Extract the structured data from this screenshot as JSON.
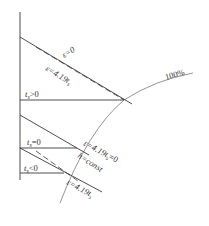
{
  "diagram": {
    "type": "psychrometric-chart-fragment",
    "curve_label": "100%",
    "labels": {
      "eps_zero": "ε=0",
      "eps_419_top": "ε=4.19t",
      "eps_419_top_sub": "s",
      "ts_pos": "t",
      "ts_pos_sub": "s",
      "ts_pos_rel": ">0",
      "ts_zero": "t",
      "ts_zero_sub": "s",
      "ts_zero_rel": "=0",
      "eps_mid": "ε=4.19t",
      "eps_mid_sub": "s",
      "eps_mid_rel": "=0",
      "h_const": "h=const",
      "ts_neg": "t",
      "ts_neg_sub": "s",
      "ts_neg_rel": "<0",
      "eps_419_bottom": "ε=4.19t",
      "eps_419_bottom_sub": "s"
    },
    "colors": {
      "line": "#3a3a3a",
      "saturation_curve": "#888888",
      "background": "#ffffff"
    }
  }
}
